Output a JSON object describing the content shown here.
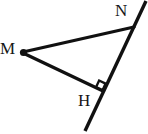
{
  "figure": {
    "kind": "geometry-diagram",
    "width": 148,
    "height": 134,
    "background_color": "#ffffff",
    "stroke_color": "#111111",
    "label_color": "#171717",
    "stroke_width": 3.2,
    "labels": {
      "m": "M",
      "n": "N",
      "h": "H"
    },
    "points": {
      "M": {
        "x": 23,
        "y": 52
      },
      "N": {
        "x": 133,
        "y": 28
      },
      "H": {
        "x": 102,
        "y": 91
      },
      "line_top": {
        "x": 146,
        "y": 1
      },
      "line_bottom": {
        "x": 85,
        "y": 131
      }
    },
    "segments": [
      {
        "name": "MN",
        "from": "M",
        "to": "N"
      },
      {
        "name": "MH",
        "from": "M",
        "to": "H"
      },
      {
        "name": "line-through-N-and-H",
        "from": "line_top",
        "to": "line_bottom"
      }
    ],
    "markers": {
      "right_angle_at_H": {
        "label": "right-angle-square",
        "size": 10
      },
      "vertex_dot_M": {
        "label": "vertex-dot",
        "radius": 3.4
      }
    }
  }
}
